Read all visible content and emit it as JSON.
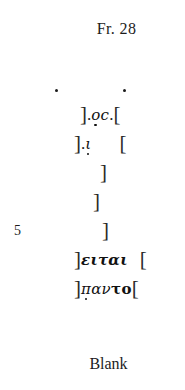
{
  "heading": {
    "label": "Fr. 28"
  },
  "traces_above": {
    "dots": [
      {
        "name": "ink-trace-dot-left",
        "x": 55,
        "y": 89
      },
      {
        "name": "ink-trace-dot-right",
        "x": 123,
        "y": 89
      }
    ]
  },
  "left_bracket": "]",
  "right_bracket": "[",
  "trace_mark": ".",
  "lines": [
    {
      "number": "",
      "text": "].ọc.[",
      "left_bracket": "]",
      "trace_before": ".",
      "letters": "ọc",
      "trace_after": ".",
      "right_bracket": "["
    },
    {
      "number": "",
      "text": "].ι̣   [",
      "left_bracket": "]",
      "trace_before": ".",
      "letters": "ι̣",
      "right_bracket": "["
    },
    {
      "number": "",
      "text": "]",
      "left_bracket": "]"
    },
    {
      "number": "",
      "text": "]",
      "left_bracket": "]"
    },
    {
      "number": "5",
      "text": "]",
      "left_bracket": "]"
    },
    {
      "number": "",
      "text": "]ειται  [",
      "left_bracket": "]",
      "letters": "ειται",
      "right_bracket": "["
    },
    {
      "number": "",
      "text": "]π̣αντο[",
      "left_bracket": "]",
      "letters_uncertain": "π̣",
      "letters_italic": "αν",
      "letters_bold": "το",
      "right_bracket": "["
    }
  ],
  "line1": {
    "left_bracket": "]",
    "trace_before": ".",
    "letter_omicron": "ο",
    "letter_sigma": "c",
    "trace_after": ".",
    "right_bracket": "["
  },
  "line2": {
    "left_bracket": "]",
    "trace_before": ".",
    "letter_iota": "ι",
    "right_bracket": "["
  },
  "line3": {
    "left_bracket": "]"
  },
  "line4": {
    "left_bracket": "]"
  },
  "line5": {
    "number": "5",
    "left_bracket": "]"
  },
  "line6": {
    "left_bracket": "]",
    "letters": "ειται",
    "right_bracket": "["
  },
  "line7": {
    "left_bracket": "]",
    "letter_pi": "π",
    "letters_mid": "αν",
    "letters_bold": "το",
    "right_bracket": "["
  },
  "footer": {
    "blank_label": "Blank"
  },
  "colors": {
    "background": "#ffffff",
    "ink": "#1a1a1a"
  }
}
